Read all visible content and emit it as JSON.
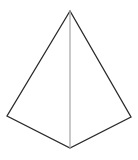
{
  "figure": {
    "name": "pyramid-wireframe",
    "type": "line-drawing",
    "background_color": "#ffffff",
    "canvas": {
      "width": 138,
      "height": 160
    },
    "stroke": {
      "silhouette_color": "#2a2a2a",
      "silhouette_width": 1.3,
      "front_edge_color": "#aaaaaa",
      "front_edge_width": 1.3,
      "linejoin": "miter",
      "linecap": "round"
    },
    "fill": "none",
    "vertices": {
      "apex": {
        "label": "apex",
        "x": 70,
        "y": 11
      },
      "base_left": {
        "label": "base-left",
        "x": 7,
        "y": 116
      },
      "base_front": {
        "label": "base-front",
        "x": 70,
        "y": 148
      },
      "base_right": {
        "label": "base-right",
        "x": 131,
        "y": 117
      }
    },
    "silhouette_path": "M 70 11 L 7 116 L 70 148 L 131 117 Z",
    "front_edge_path": "M 70 11 L 70 148",
    "edges": [
      {
        "name": "edge-apex-to-base-left",
        "from": "apex",
        "to": "base_left",
        "style": "silhouette"
      },
      {
        "name": "edge-base-left-to-front",
        "from": "base_left",
        "to": "base_front",
        "style": "silhouette"
      },
      {
        "name": "edge-front-to-base-right",
        "from": "base_front",
        "to": "base_right",
        "style": "silhouette"
      },
      {
        "name": "edge-base-right-to-apex",
        "from": "base_right",
        "to": "apex",
        "style": "silhouette"
      },
      {
        "name": "edge-apex-to-base-front",
        "from": "apex",
        "to": "base_front",
        "style": "front"
      }
    ]
  }
}
